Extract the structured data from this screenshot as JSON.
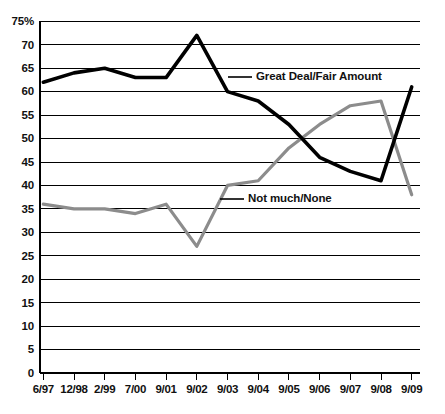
{
  "chart_data": {
    "type": "line",
    "title": "",
    "xlabel": "",
    "ylabel": "",
    "ylim": [
      0,
      75
    ],
    "yticks": [
      0,
      5,
      10,
      15,
      20,
      25,
      30,
      35,
      40,
      45,
      50,
      55,
      60,
      65,
      70,
      75
    ],
    "ytick_labels": [
      "0",
      "5",
      "10",
      "15",
      "20",
      "25",
      "30",
      "35",
      "40",
      "45",
      "50",
      "55",
      "60",
      "65",
      "70",
      "75%"
    ],
    "grid": true,
    "legend_position": "inline-annotation",
    "categories": [
      "6/97",
      "12/98",
      "2/99",
      "7/00",
      "9/01",
      "9/02",
      "9/03",
      "9/04",
      "9/05",
      "9/06",
      "9/07",
      "9/08",
      "9/09"
    ],
    "series": [
      {
        "name": "Great Deal/Fair Amount",
        "color": "#000000",
        "values": [
          62,
          64,
          65,
          63,
          63,
          72,
          60,
          58,
          53,
          46,
          43,
          41,
          61
        ]
      },
      {
        "name": "Not much/None",
        "color": "#8c8c8c",
        "values": [
          36,
          35,
          35,
          34,
          36,
          27,
          40,
          41,
          48,
          53,
          57,
          58,
          38
        ]
      }
    ],
    "annotations": [
      {
        "text": "Great Deal/Fair Amount",
        "series": "Great Deal/Fair Amount"
      },
      {
        "text": "Not much/None",
        "series": "Not much/None"
      }
    ]
  },
  "axis": {
    "y_labels": [
      "75%",
      "70",
      "65",
      "60",
      "55",
      "50",
      "45",
      "40",
      "35",
      "30",
      "25",
      "20",
      "15",
      "10",
      "5",
      "0"
    ],
    "x_labels": [
      "6/97",
      "12/98",
      "2/99",
      "7/00",
      "9/01",
      "9/02",
      "9/03",
      "9/04",
      "9/05",
      "9/06",
      "9/07",
      "9/08",
      "9/09"
    ]
  },
  "colors": {
    "series_dark": "#000000",
    "series_gray": "#8c8c8c",
    "grid": "#000000",
    "background": "#ffffff"
  }
}
